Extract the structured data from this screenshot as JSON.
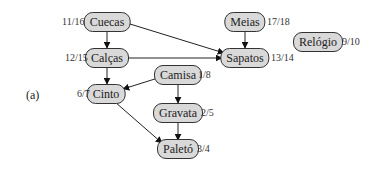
{
  "figure_label": "(a)",
  "nodes": {
    "cuecas": {
      "label": "Cuecas",
      "time": "11/16"
    },
    "calcas": {
      "label": "Calças",
      "time": "12/15"
    },
    "cinto": {
      "label": "Cinto",
      "time": "6/7"
    },
    "camisa": {
      "label": "Camisa",
      "time": "1/8"
    },
    "gravata": {
      "label": "Gravata",
      "time": "2/5"
    },
    "paleto": {
      "label": "Paletó",
      "time": "3/4"
    },
    "meias": {
      "label": "Meias",
      "time": "17/18"
    },
    "sapatos": {
      "label": "Sapatos",
      "time": "13/14"
    },
    "relogio": {
      "label": "Relógio",
      "time": "9/10"
    }
  },
  "edges": [
    {
      "from": "Cuecas",
      "to": "Calças"
    },
    {
      "from": "Cuecas",
      "to": "Sapatos"
    },
    {
      "from": "Calças",
      "to": "Sapatos"
    },
    {
      "from": "Calças",
      "to": "Cinto"
    },
    {
      "from": "Camisa",
      "to": "Cinto"
    },
    {
      "from": "Camisa",
      "to": "Gravata"
    },
    {
      "from": "Gravata",
      "to": "Paletó"
    },
    {
      "from": "Cinto",
      "to": "Paletó"
    },
    {
      "from": "Meias",
      "to": "Sapatos"
    }
  ]
}
